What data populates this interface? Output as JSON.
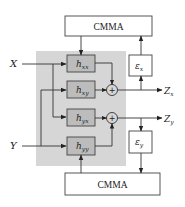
{
  "diagram": {
    "top_block": {
      "label": "CMMA"
    },
    "bottom_block": {
      "label": "CMMA"
    },
    "inputs": [
      {
        "id": "X",
        "label": "X"
      },
      {
        "id": "Y",
        "label": "Y"
      }
    ],
    "filters": [
      {
        "id": "hxx",
        "base": "h",
        "sub": "xx"
      },
      {
        "id": "hxy",
        "base": "h",
        "sub": "xy"
      },
      {
        "id": "hyx",
        "base": "h",
        "sub": "yx"
      },
      {
        "id": "hyy",
        "base": "h",
        "sub": "yy"
      }
    ],
    "adders": [
      {
        "id": "sum_x",
        "symbol": "+"
      },
      {
        "id": "sum_y",
        "symbol": "+"
      }
    ],
    "error_blocks": [
      {
        "id": "eps_x",
        "base": "ε",
        "sub": "x"
      },
      {
        "id": "eps_y",
        "base": "ε",
        "sub": "y"
      }
    ],
    "outputs": [
      {
        "id": "Zx",
        "base": "Z",
        "sub": "x"
      },
      {
        "id": "Zy",
        "base": "Z",
        "sub": "y"
      }
    ],
    "colors": {
      "region": "#d6d6d6",
      "filter_fill": "#bcbcbc",
      "line": "#333333"
    }
  }
}
